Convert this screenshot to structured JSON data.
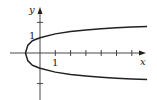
{
  "chart_data": {
    "type": "line",
    "title": "",
    "xlabel": "x",
    "ylabel": "y",
    "x_tick_label": "1",
    "y_tick_label": "1",
    "xlim": [
      -1.3,
      7.2
    ],
    "ylim": [
      -3.0,
      3.4
    ],
    "grid": false,
    "legend": [],
    "series": [
      {
        "name": "upper branch",
        "points": [
          [
            -0.95,
            0
          ],
          [
            -0.8,
            0.5
          ],
          [
            -0.5,
            0.8
          ],
          [
            0,
            1.0
          ],
          [
            1,
            1.25
          ],
          [
            2,
            1.4
          ],
          [
            3,
            1.5
          ],
          [
            4,
            1.58
          ],
          [
            5,
            1.65
          ],
          [
            6,
            1.7
          ],
          [
            7,
            1.74
          ]
        ]
      },
      {
        "name": "lower branch",
        "points": [
          [
            -0.95,
            0
          ],
          [
            -0.8,
            -0.5
          ],
          [
            -0.5,
            -0.8
          ],
          [
            0,
            -1.0
          ],
          [
            1,
            -1.25
          ],
          [
            2,
            -1.4
          ],
          [
            3,
            -1.5
          ],
          [
            4,
            -1.58
          ],
          [
            5,
            -1.65
          ],
          [
            6,
            -1.7
          ],
          [
            7,
            -1.74
          ]
        ]
      }
    ],
    "x_ticks": [
      1,
      2,
      3,
      4,
      5,
      6
    ],
    "y_ticks": [
      -2,
      2
    ]
  }
}
